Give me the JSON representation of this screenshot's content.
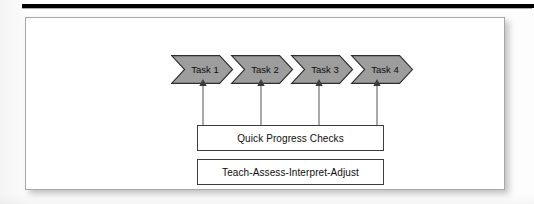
{
  "figure": {
    "top_rule": "horizontal-rule",
    "frame": "figure-border",
    "colors": {
      "chevron_fill": "#9d9d9d",
      "chevron_stroke": "#2e2e2e",
      "box_stroke": "#3c3c3c",
      "frame_stroke": "#a8a8a8",
      "connector_stroke": "#5a5a5a",
      "page_background": "#ffffff",
      "top_rule": "#000000"
    },
    "chevrons": [
      {
        "label": "Task 1"
      },
      {
        "label": "Task 2"
      },
      {
        "label": "Task 3"
      },
      {
        "label": "Task 4"
      }
    ],
    "connectors": [
      {
        "from": "Quick Progress Checks",
        "to": "Task 1",
        "direction": "up"
      },
      {
        "from": "Quick Progress Checks",
        "to": "Task 2",
        "direction": "up"
      },
      {
        "from": "Quick Progress Checks",
        "to": "Task 3",
        "direction": "up"
      },
      {
        "from": "Quick Progress Checks",
        "to": "Task 4",
        "direction": "up"
      }
    ],
    "boxes": {
      "progress": {
        "label": "Quick Progress Checks"
      },
      "cycle": {
        "label": "Teach-Assess-Interpret-Adjust"
      }
    }
  }
}
